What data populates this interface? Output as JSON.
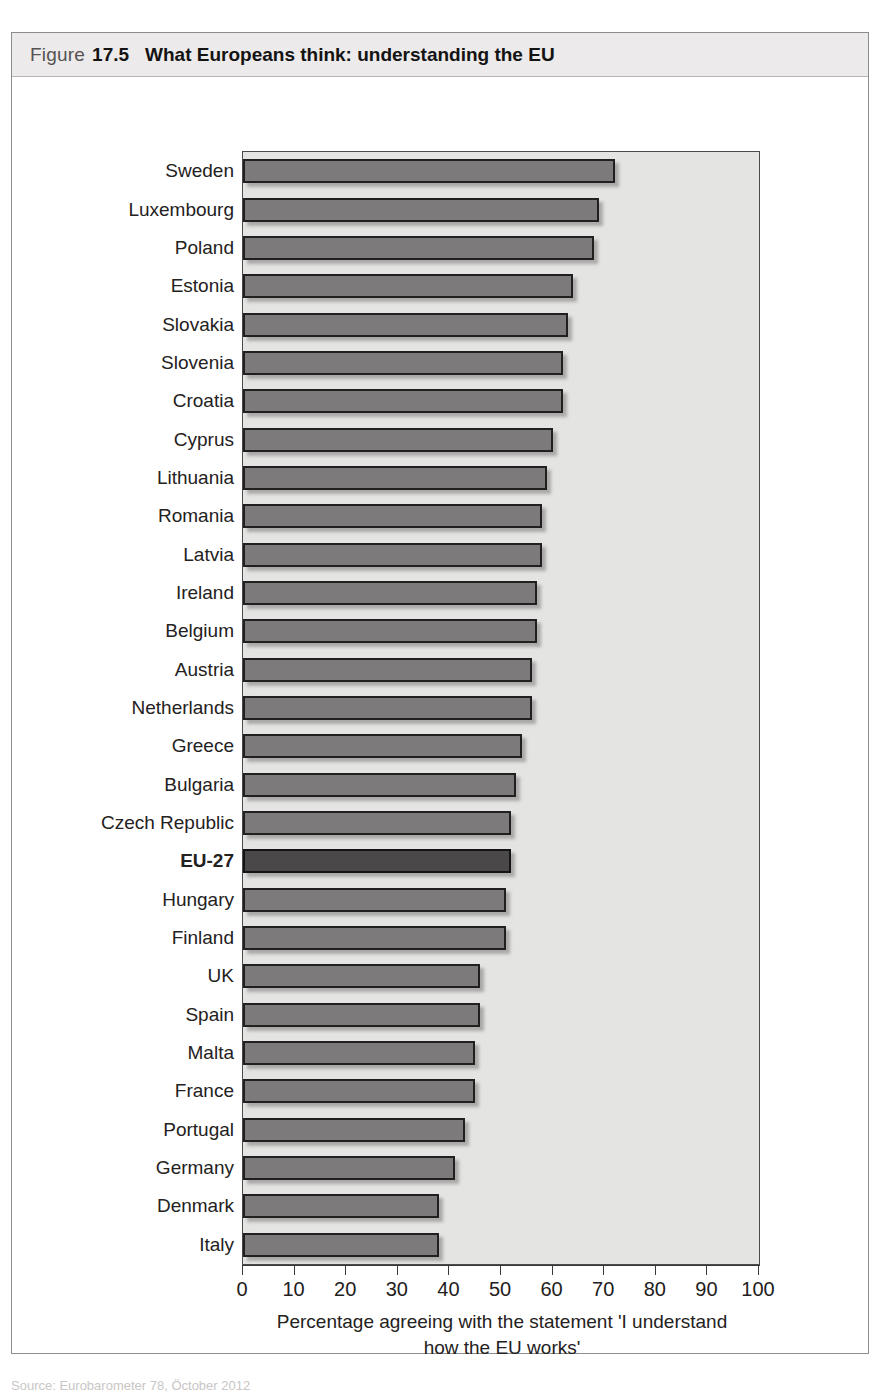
{
  "figure": {
    "label": "Figure",
    "number": "17.5",
    "title": "What Europeans think: understanding the EU",
    "source_partial": "Source: Eurobarometer 78, Öctober 2012"
  },
  "chart_data": {
    "type": "bar",
    "orientation": "horizontal",
    "title": "What Europeans think: understanding the EU",
    "xlabel": "Percentage agreeing with the statement 'I understand how the EU works'",
    "ylabel": "",
    "xlim": [
      0,
      100
    ],
    "xticks": [
      0,
      10,
      20,
      30,
      40,
      50,
      60,
      70,
      80,
      90,
      100
    ],
    "grid": false,
    "legend": false,
    "highlight_category": "EU-27",
    "colors": {
      "bar_fill": "#7c7a7a",
      "bar_border": "#211f1f",
      "highlight_fill": "#4a4848",
      "plot_background": "#e4e4e2",
      "header_background": "#eceaea",
      "text": "#242121"
    },
    "categories": [
      "Sweden",
      "Luxembourg",
      "Poland",
      "Estonia",
      "Slovakia",
      "Slovenia",
      "Croatia",
      "Cyprus",
      "Lithuania",
      "Romania",
      "Latvia",
      "Ireland",
      "Belgium",
      "Austria",
      "Netherlands",
      "Greece",
      "Bulgaria",
      "Czech Republic",
      "EU-27",
      "Hungary",
      "Finland",
      "UK",
      "Spain",
      "Malta",
      "France",
      "Portugal",
      "Germany",
      "Denmark",
      "Italy"
    ],
    "values": [
      72,
      69,
      68,
      64,
      63,
      62,
      62,
      60,
      59,
      58,
      58,
      57,
      57,
      56,
      56,
      54,
      53,
      52,
      52,
      51,
      51,
      46,
      46,
      45,
      45,
      43,
      41,
      38,
      38
    ],
    "caption_line_1": "Percentage agreeing with the statement 'I understand",
    "caption_line_2": "how the EU works'"
  },
  "axis": {
    "tick_labels": [
      "0",
      "10",
      "20",
      "30",
      "40",
      "50",
      "60",
      "70",
      "80",
      "90",
      "100"
    ]
  }
}
